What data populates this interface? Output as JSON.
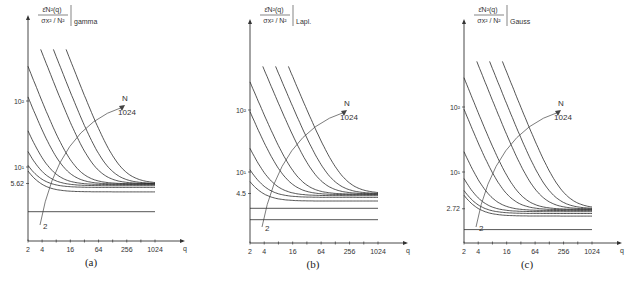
{
  "figure": {
    "caption_fragment": "Fig.",
    "y_label_numerator": "ε̄N²(q)",
    "y_label_denominator": "σx² / N²",
    "x_label": "q",
    "annotation_N": "N",
    "annotation_N_max": "1024",
    "annotation_N_min": "2"
  },
  "chart_data": [
    {
      "type": "line",
      "panel": "(a)",
      "distribution": "gamma",
      "title": "gamma",
      "xlabel": "q",
      "ylabel": "ε̄N²(q) / (σx²/N²)",
      "xscale": "log2",
      "yscale": "log",
      "x_ticks": [
        "2",
        "4",
        "16",
        "64",
        "256",
        "1024"
      ],
      "y_ticks": [
        "10²",
        "10¹",
        "5.62"
      ],
      "y_tick_values": [
        100,
        10,
        5.62
      ],
      "asymptote": 5.62,
      "N_values": [
        2,
        4,
        8,
        16,
        32,
        64,
        128,
        256,
        512,
        1024
      ],
      "series_start_y": [
        2.1,
        4.5,
        5.7,
        12,
        30,
        110,
        330,
        600,
        600,
        600
      ],
      "series_plateau_y": [
        2.1,
        4.2,
        4.9,
        5.2,
        5.4,
        5.5,
        5.55,
        5.58,
        5.6,
        5.62
      ]
    },
    {
      "type": "line",
      "panel": "(b)",
      "distribution": "Lapl.",
      "title": "Lapl.",
      "xlabel": "q",
      "ylabel": "ε̄N²(q) / (σx²/N²)",
      "xscale": "log2",
      "yscale": "log",
      "x_ticks": [
        "2",
        "4",
        "16",
        "64",
        "256",
        "1024"
      ],
      "y_ticks": [
        "10²",
        "10¹",
        "4.5"
      ],
      "y_tick_values": [
        100,
        10,
        4.5
      ],
      "asymptote": 4.5,
      "N_values": [
        2,
        4,
        8,
        16,
        32,
        64,
        128,
        256,
        512,
        1024
      ],
      "series_start_y": [
        1.7,
        2.6,
        3.6,
        7,
        20,
        90,
        280,
        500,
        500,
        500
      ],
      "series_plateau_y": [
        1.7,
        2.6,
        3.4,
        3.9,
        4.15,
        4.3,
        4.38,
        4.43,
        4.47,
        4.5
      ]
    },
    {
      "type": "line",
      "panel": "(c)",
      "distribution": "Gauss",
      "title": "Gauss",
      "xlabel": "q",
      "ylabel": "ε̄N²(q) / (σx²/N²)",
      "xscale": "log2",
      "yscale": "log",
      "x_ticks": [
        "2",
        "4",
        "16",
        "64",
        "256",
        "1024"
      ],
      "y_ticks": [
        "10²",
        "10¹",
        "2.72"
      ],
      "y_tick_values": [
        100,
        10,
        2.72
      ],
      "asymptote": 2.72,
      "N_values": [
        2,
        4,
        8,
        16,
        32,
        64,
        128,
        256,
        512,
        1024
      ],
      "series_start_y": [
        1.3,
        2.3,
        2.9,
        5.5,
        18,
        90,
        280,
        500,
        500,
        500
      ],
      "series_plateau_y": [
        1.3,
        2.1,
        2.3,
        2.45,
        2.55,
        2.62,
        2.66,
        2.69,
        2.71,
        2.72
      ]
    }
  ]
}
